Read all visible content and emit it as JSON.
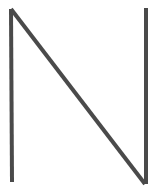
{
  "image": {
    "kind": "line-drawing",
    "subject": "letter-n",
    "description": "Hand-drawn capital letter N formed by three straight strokes",
    "width": 159,
    "height": 196,
    "background_color": "#ffffff",
    "stroke_color": "#4a4a4a",
    "stroke_width": 4,
    "caption": "N"
  },
  "strokes": [
    {
      "name": "left-vertical-stroke",
      "role": "left stem of N",
      "x1": 11,
      "y1": 9,
      "x2": 12,
      "y2": 182
    },
    {
      "name": "diagonal-stroke",
      "role": "diagonal of N descending left to right",
      "x1": 11,
      "y1": 9,
      "x2": 145,
      "y2": 184
    },
    {
      "name": "right-vertical-stroke",
      "role": "right stem of N",
      "x1": 146,
      "y1": 8,
      "x2": 146,
      "y2": 184
    }
  ]
}
